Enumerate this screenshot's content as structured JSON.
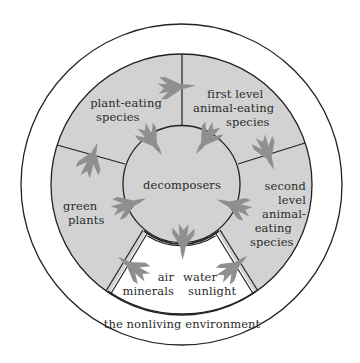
{
  "diagram": {
    "title": "",
    "colors": {
      "shaded": "#d2d2d2",
      "arrow": "#8f8f8f",
      "line": "#222222",
      "background": "#ffffff"
    },
    "labels": {
      "plant_eating": [
        "plant-eating",
        "species"
      ],
      "first_level": [
        "first level",
        "animal-eating",
        "species"
      ],
      "second_level": [
        "second",
        "level",
        "animal-",
        "eating",
        "species"
      ],
      "green_plants": [
        "green",
        "plants"
      ],
      "decomposers": "decomposers",
      "nonliving_left": [
        "air",
        "minerals"
      ],
      "nonliving_right": [
        "water",
        "sunlight"
      ],
      "environment": "the nonliving environment"
    },
    "nodes": [
      "green plants",
      "plant-eating species",
      "first level animal-eating species",
      "second level animal-eating species",
      "decomposers",
      "air, minerals, water, sunlight",
      "the nonliving environment"
    ],
    "flows": [
      {
        "from": "air, minerals, water, sunlight",
        "to": "green plants"
      },
      {
        "from": "green plants",
        "to": "plant-eating species"
      },
      {
        "from": "plant-eating species",
        "to": "first level animal-eating species"
      },
      {
        "from": "first level animal-eating species",
        "to": "second level animal-eating species"
      },
      {
        "from": "green plants",
        "to": "decomposers"
      },
      {
        "from": "plant-eating species",
        "to": "decomposers"
      },
      {
        "from": "first level animal-eating species",
        "to": "decomposers"
      },
      {
        "from": "second level animal-eating species",
        "to": "decomposers"
      },
      {
        "from": "decomposers",
        "to": "air, minerals, water, sunlight"
      },
      {
        "from": "air, minerals, water, sunlight",
        "to": "second level animal-eating species"
      }
    ]
  }
}
